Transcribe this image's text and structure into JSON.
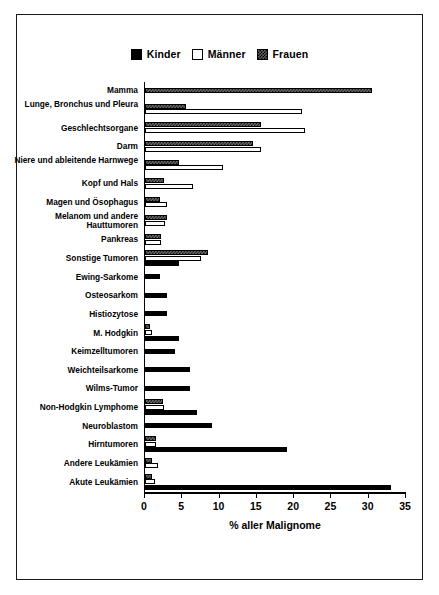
{
  "legend": {
    "entries": [
      {
        "label": "Kinder",
        "key": "kinder",
        "color": "#000000"
      },
      {
        "label": "Männer",
        "key": "maenner",
        "color": "#ffffff"
      },
      {
        "label": "Frauen",
        "key": "frauen",
        "color": "#5e5e5e"
      }
    ]
  },
  "chart_data": {
    "type": "bar",
    "orientation": "horizontal",
    "title": "",
    "xlabel": "% aller Malignome",
    "ylabel": "",
    "xlim": [
      0,
      35
    ],
    "xticks": [
      0,
      5,
      10,
      15,
      20,
      25,
      30,
      35
    ],
    "xtick_labels": [
      "0",
      "5",
      "10",
      "15",
      "20",
      "25",
      "30",
      "35"
    ],
    "grid": false,
    "legend_position": "top-center",
    "categories": [
      "Mamma",
      "Lunge, Bronchus und Pleura",
      "Geschlechtsorgane",
      "Darm",
      "Niere und ableitende Harnwege",
      "Kopf und Hals",
      "Magen und Ösophagus",
      "Melanom und andere Hauttumoren",
      "Pankreas",
      "Sonstige Tumoren",
      "Ewing-Sarkome",
      "Osteosarkom",
      "Histiozytose",
      "M. Hodgkin",
      "Keimzelltumoren",
      "Weichteilsarkome",
      "Wilms-Tumor",
      "Non-Hodgkin Lymphome",
      "Neuroblastom",
      "Hirntumoren",
      "Andere Leukämien",
      "Akute Leukämien"
    ],
    "series": [
      {
        "name": "Kinder",
        "key": "kinder",
        "values": [
          0,
          0,
          0,
          0,
          0,
          0,
          0,
          0,
          0,
          4.5,
          2.0,
          3.0,
          3.0,
          4.5,
          4.0,
          6.0,
          6.0,
          7.0,
          9.0,
          19.0,
          0,
          33.0
        ]
      },
      {
        "name": "Männer",
        "key": "maenner",
        "values": [
          0,
          21.0,
          21.5,
          15.5,
          10.5,
          6.5,
          3.0,
          2.7,
          2.2,
          7.5,
          0,
          0,
          0,
          0.9,
          0,
          0,
          0,
          2.6,
          0,
          1.5,
          1.8,
          1.3
        ]
      },
      {
        "name": "Frauen",
        "key": "frauen",
        "values": [
          30.5,
          5.5,
          15.5,
          14.5,
          4.5,
          2.5,
          2.0,
          3.0,
          2.2,
          8.5,
          0,
          0,
          0,
          0.7,
          0,
          0,
          0,
          2.4,
          0,
          1.5,
          1.0,
          1.0
        ]
      }
    ]
  }
}
